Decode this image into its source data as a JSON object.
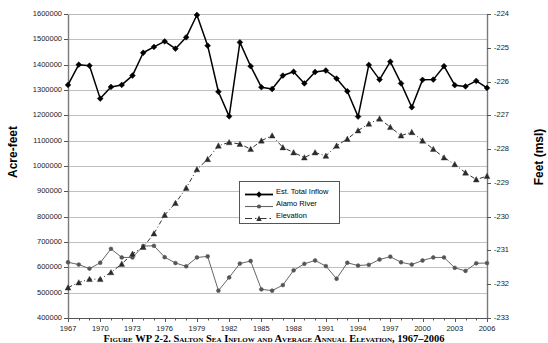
{
  "figure": {
    "caption": "Figure WP 2-2.  Salton Sea Inflow and Average Annual Elevation, 1967–2006"
  },
  "chart_data": {
    "type": "line",
    "title": "",
    "xlabel": "",
    "ylabel": "Acre-feet",
    "y2label": "Feet (msl)",
    "xlim": [
      1967,
      2006
    ],
    "ylim": [
      400000,
      1600000
    ],
    "y2lim": [
      -233,
      -224
    ],
    "grid": true,
    "legend_position": "center",
    "x": [
      1967,
      1968,
      1969,
      1970,
      1971,
      1972,
      1973,
      1974,
      1975,
      1976,
      1977,
      1978,
      1979,
      1980,
      1981,
      1982,
      1983,
      1984,
      1985,
      1986,
      1987,
      1988,
      1989,
      1990,
      1991,
      1992,
      1993,
      1994,
      1995,
      1996,
      1997,
      1998,
      1999,
      2000,
      2001,
      2002,
      2003,
      2004,
      2005,
      2006
    ],
    "xticklabels": [
      "1967",
      "1970",
      "1973",
      "1976",
      "1979",
      "1982",
      "1985",
      "1988",
      "1991",
      "1994",
      "1997",
      "2000",
      "2003",
      "2006"
    ],
    "yticklabels": [
      "400000",
      "500000",
      "600000",
      "700000",
      "800000",
      "900000",
      "1000000",
      "1100000",
      "1200000",
      "1300000",
      "1400000",
      "1500000",
      "1600000"
    ],
    "y2ticklabels": [
      "-233",
      "-232",
      "-231",
      "-230",
      "-229",
      "-228",
      "-227",
      "-226",
      "-225",
      "-224"
    ],
    "series": [
      {
        "name": "Est. Total Inflow",
        "axis": "left",
        "marker": "diamond",
        "linestyle": "solid",
        "color": "#000000",
        "values": [
          1320000,
          1400000,
          1396000,
          1266000,
          1312000,
          1320000,
          1357000,
          1447000,
          1470000,
          1492000,
          1463000,
          1508000,
          1596000,
          1475000,
          1293000,
          1196000,
          1488000,
          1394000,
          1311000,
          1304000,
          1357000,
          1372000,
          1326000,
          1371000,
          1377000,
          1345000,
          1295000,
          1195000,
          1399000,
          1341000,
          1412000,
          1326000,
          1232000,
          1340000,
          1341000,
          1394000,
          1319000,
          1314000,
          1336000,
          1308000
        ]
      },
      {
        "name": "Alamo River",
        "axis": "left",
        "marker": "circle",
        "linestyle": "solid",
        "color": "#666666",
        "values": [
          620000,
          611000,
          595000,
          618000,
          673000,
          639000,
          639000,
          684000,
          685000,
          640000,
          617000,
          604000,
          639000,
          643000,
          508000,
          560000,
          615000,
          625000,
          513000,
          508000,
          530000,
          588000,
          614000,
          627000,
          605000,
          555000,
          618000,
          607000,
          610000,
          631000,
          642000,
          620000,
          611000,
          627000,
          639000,
          639000,
          598000,
          586000,
          616000,
          617000
        ]
      },
      {
        "name": "Elevation",
        "axis": "right",
        "marker": "triangle",
        "linestyle": "dashed",
        "color": "#333333",
        "values": [
          -232.1,
          -231.95,
          -231.85,
          -231.85,
          -231.65,
          -231.4,
          -231.1,
          -230.9,
          -230.5,
          -229.95,
          -229.6,
          -229.15,
          -228.6,
          -228.3,
          -227.9,
          -227.8,
          -227.85,
          -228.0,
          -227.75,
          -227.6,
          -227.95,
          -228.1,
          -228.25,
          -228.1,
          -228.2,
          -227.9,
          -227.7,
          -227.45,
          -227.25,
          -227.1,
          -227.35,
          -227.6,
          -227.5,
          -227.75,
          -228.0,
          -228.25,
          -228.45,
          -228.7,
          -228.9,
          -228.8
        ]
      }
    ]
  }
}
